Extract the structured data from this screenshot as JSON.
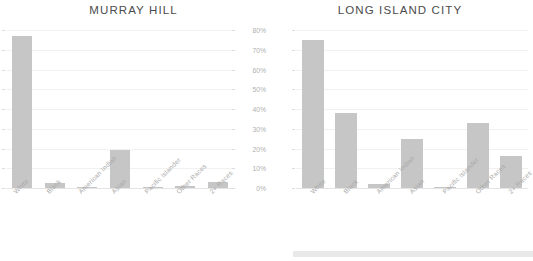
{
  "chart_data": [
    {
      "type": "bar",
      "title": "MURRAY HILL",
      "categories": [
        "White",
        "Black",
        "American Indian",
        "Asian",
        "Pacific Islander",
        "Other Races",
        "2+ Races"
      ],
      "values": [
        77,
        2.5,
        0.5,
        19,
        0,
        0.8,
        3
      ],
      "xlabel": "",
      "ylabel": "",
      "ylim": [
        0,
        80
      ],
      "yticks": [
        0,
        10,
        20,
        30,
        40,
        50,
        60,
        70,
        80
      ],
      "ytick_labels": [
        "0%",
        "10%",
        "20%",
        "30%",
        "40%",
        "50%",
        "60%",
        "70%",
        "80%"
      ],
      "ytick_labels_visible": false,
      "grid": true,
      "legend": "none",
      "bar_color": "#c6c6c6"
    },
    {
      "type": "bar",
      "title": "LONG ISLAND CITY",
      "categories": [
        "White",
        "Black",
        "American Indian",
        "Asian",
        "Pacific Islander",
        "Other Races",
        "2+ Races"
      ],
      "values": [
        75,
        38,
        2,
        25,
        0.5,
        33,
        16
      ],
      "xlabel": "",
      "ylabel": "",
      "ylim": [
        0,
        80
      ],
      "yticks": [
        0,
        10,
        20,
        30,
        40,
        50,
        60,
        70,
        80
      ],
      "ytick_labels": [
        "0%",
        "10%",
        "20%",
        "30%",
        "40%",
        "50%",
        "60%",
        "70%",
        "80%"
      ],
      "ytick_labels_visible": true,
      "grid": true,
      "legend": "none",
      "bar_color": "#c6c6c6"
    }
  ],
  "colors": {
    "bar": "#c6c6c6",
    "gridline": "#f1f1f1",
    "axis_line": "#e4e4e4",
    "title_text": "#4c4c4c",
    "tick_text": "#b0b0b0",
    "category_text": "#a8a8a8",
    "bottom_band": "#e9e9e9",
    "background": "#ffffff"
  }
}
